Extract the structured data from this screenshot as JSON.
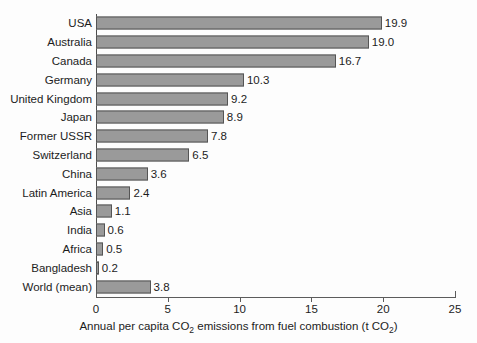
{
  "chart_data": {
    "type": "bar",
    "orientation": "horizontal",
    "title": "",
    "subtitle": "",
    "xlabel": "Annual per capita CO2 emissions from fuel combustion (t CO2)",
    "ylabel": "",
    "xlim": [
      0,
      25
    ],
    "xticks": [
      0,
      5,
      10,
      15,
      20,
      25
    ],
    "xtick_labels": [
      "0",
      "5",
      "10",
      "15",
      "20",
      "25"
    ],
    "grid": false,
    "legend": null,
    "bar_color": "#9a9a9a",
    "bar_edge_color": "#555555",
    "background_color": "#fdfdfd",
    "categories": [
      "USA",
      "Australia",
      "Canada",
      "Germany",
      "United Kingdom",
      "Japan",
      "Former USSR",
      "Switzerland",
      "China",
      "Latin America",
      "Asia",
      "India",
      "Africa",
      "Bangladesh",
      "World (mean)"
    ],
    "values": [
      19.9,
      19.0,
      16.7,
      10.3,
      9.2,
      8.9,
      7.8,
      6.5,
      3.6,
      2.4,
      1.1,
      0.6,
      0.5,
      0.2,
      3.8
    ],
    "value_labels": [
      "19.9",
      "19.0",
      "16.7",
      "10.3",
      "9.2",
      "8.9",
      "7.8",
      "6.5",
      "3.6",
      "2.4",
      "1.1",
      "0.6",
      "0.5",
      "0.2",
      "3.8"
    ]
  },
  "axis_title": {
    "part1": "Annual per capita CO",
    "sub1": "2",
    "part2": " emissions from fuel combustion (t CO",
    "sub2": "2",
    "part3": ")"
  }
}
